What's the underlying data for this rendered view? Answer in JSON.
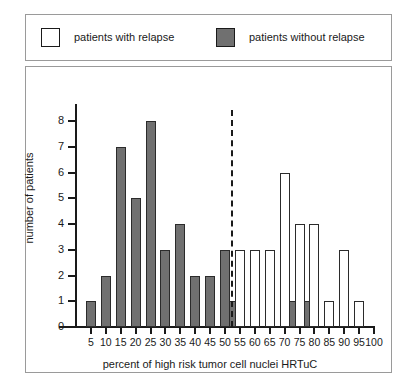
{
  "legend": {
    "entries": [
      {
        "label": "patients with relapse",
        "swatch": "white-square-icon",
        "color": "#ffffff"
      },
      {
        "label": "patients without relapse",
        "swatch": "gray-square-icon",
        "color": "#707070"
      }
    ]
  },
  "chart_data": {
    "type": "bar",
    "title": "",
    "xlabel": "percent of high risk tumor cell nuclei HRTuC",
    "ylabel": "number of patients",
    "xlim": [
      0,
      100
    ],
    "ylim": [
      0,
      8
    ],
    "yticks": [
      0,
      1,
      2,
      3,
      4,
      5,
      6,
      7,
      8
    ],
    "xticks": [
      5,
      10,
      15,
      20,
      25,
      30,
      35,
      40,
      45,
      50,
      55,
      60,
      65,
      70,
      75,
      80,
      85,
      90,
      95,
      100
    ],
    "grid": false,
    "legend_position": "top",
    "annotations": [
      {
        "type": "threshold-line",
        "style": "dashed",
        "x": 52.5,
        "label": ""
      }
    ],
    "series": [
      {
        "name": "patients without relapse",
        "color": "#707070",
        "points": [
          {
            "x": 5,
            "y": 1
          },
          {
            "x": 10,
            "y": 2
          },
          {
            "x": 15,
            "y": 7
          },
          {
            "x": 20,
            "y": 5
          },
          {
            "x": 25,
            "y": 8
          },
          {
            "x": 30,
            "y": 3
          },
          {
            "x": 35,
            "y": 4
          },
          {
            "x": 40,
            "y": 2
          },
          {
            "x": 45,
            "y": 2
          },
          {
            "x": 50,
            "y": 3
          },
          {
            "x": 53,
            "y": 1
          },
          {
            "x": 73,
            "y": 1
          },
          {
            "x": 78,
            "y": 1
          }
        ]
      },
      {
        "name": "patients with relapse",
        "color": "#ffffff",
        "points": [
          {
            "x": 55,
            "y": 3
          },
          {
            "x": 60,
            "y": 3
          },
          {
            "x": 65,
            "y": 3
          },
          {
            "x": 70,
            "y": 6
          },
          {
            "x": 75,
            "y": 4
          },
          {
            "x": 80,
            "y": 4
          },
          {
            "x": 85,
            "y": 1
          },
          {
            "x": 90,
            "y": 3
          },
          {
            "x": 95,
            "y": 1
          }
        ]
      }
    ]
  }
}
